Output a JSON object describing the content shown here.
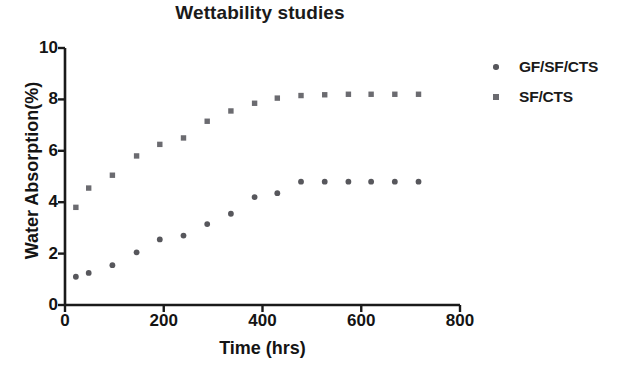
{
  "chart_data": {
    "type": "scatter",
    "title": "Wettability studies",
    "xlabel": "Time (hrs)",
    "ylabel": "Water Absorption(%)",
    "xlim": [
      0,
      800
    ],
    "ylim": [
      0,
      10
    ],
    "xticks": [
      0,
      200,
      400,
      600,
      800
    ],
    "yticks": [
      0,
      2,
      4,
      6,
      8,
      10
    ],
    "grid": false,
    "legend_position": "right",
    "marker_color": "#57575c",
    "axis_color": "#1a1a1a",
    "series": [
      {
        "name": "GF/SF/CTS",
        "marker": "circle",
        "color": "#57575c",
        "x": [
          22,
          48,
          96,
          145,
          192,
          240,
          288,
          336,
          384,
          430,
          478,
          526,
          574,
          620,
          668,
          716
        ],
        "y": [
          1.1,
          1.25,
          1.55,
          2.05,
          2.55,
          2.7,
          3.15,
          3.55,
          4.2,
          4.35,
          4.8,
          4.8,
          4.8,
          4.8,
          4.8,
          4.8
        ]
      },
      {
        "name": "SF/CTS",
        "marker": "square",
        "color": "#6b6b70",
        "x": [
          22,
          48,
          96,
          145,
          192,
          240,
          288,
          336,
          384,
          430,
          478,
          526,
          574,
          620,
          668,
          716
        ],
        "y": [
          3.8,
          4.55,
          5.05,
          5.8,
          6.25,
          6.5,
          7.15,
          7.55,
          7.85,
          8.05,
          8.15,
          8.18,
          8.2,
          8.2,
          8.2,
          8.2
        ]
      }
    ]
  },
  "legend": {
    "items": [
      {
        "label": "GF/SF/CTS",
        "marker": "circle",
        "color": "#57575c"
      },
      {
        "label": "SF/CTS",
        "marker": "square",
        "color": "#6b6b70"
      }
    ]
  }
}
